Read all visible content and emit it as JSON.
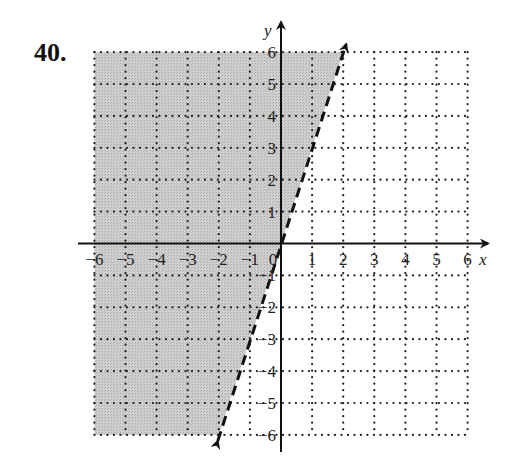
{
  "problem": {
    "number_label": "40."
  },
  "chart_data": {
    "type": "line",
    "title": "",
    "xlabel": "x",
    "ylabel": "y",
    "xlim": [
      -6,
      6
    ],
    "ylim": [
      -6,
      6
    ],
    "grid": true,
    "grid_style": "dotted",
    "x_ticks": [
      "-6",
      "-5",
      "-4",
      "-3",
      "-2",
      "-1",
      "0",
      "1",
      "2",
      "3",
      "4",
      "5",
      "6"
    ],
    "y_ticks": [
      "-6",
      "-5",
      "-4",
      "-3",
      "-2",
      "-1",
      "1",
      "2",
      "3",
      "4",
      "5",
      "6"
    ],
    "series": [
      {
        "name": "boundary line y = 3x",
        "style": "dashed",
        "color": "#111111",
        "x": [
          -2,
          2
        ],
        "y": [
          -6,
          6
        ],
        "arrows": "both"
      }
    ],
    "shaded_region": {
      "description": "region to the left of the dashed line (y > 3x)",
      "color": "#c8c8c8",
      "polygon": [
        [
          -6,
          6
        ],
        [
          2,
          6
        ],
        [
          -2,
          -6
        ],
        [
          -6,
          -6
        ]
      ]
    }
  },
  "labels": {
    "x_ticks_display": [
      "−6",
      "−5",
      "−4",
      "−3",
      "−2",
      "−1",
      "0",
      "1",
      "2",
      "3",
      "4",
      "5",
      "6"
    ],
    "y_ticks_display": {
      "pos": [
        "1",
        "2",
        "3",
        "4",
        "5",
        "6"
      ],
      "neg": [
        "−1",
        "−2",
        "−3",
        "−4",
        "−5",
        "−6"
      ]
    },
    "x_axis": "x",
    "y_axis": "y"
  }
}
